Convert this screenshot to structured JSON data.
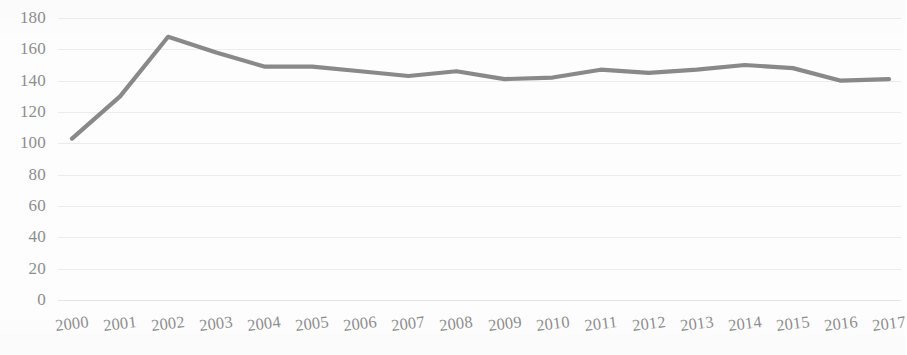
{
  "chart_data": {
    "type": "line",
    "title": "",
    "subtitle": "",
    "xlabel": "",
    "ylabel": "",
    "categories": [
      "2000",
      "2001",
      "2002",
      "2003",
      "2004",
      "2005",
      "2006",
      "2007",
      "2008",
      "2009",
      "2010",
      "2011",
      "2012",
      "2013",
      "2014",
      "2015",
      "2016",
      "2017"
    ],
    "values": [
      103,
      130,
      168,
      158,
      149,
      149,
      146,
      143,
      146,
      141,
      142,
      147,
      145,
      147,
      150,
      148,
      140,
      141
    ],
    "series": [
      {
        "name": "Series 1",
        "values": [
          103,
          130,
          168,
          158,
          149,
          149,
          146,
          143,
          146,
          141,
          142,
          147,
          145,
          147,
          150,
          148,
          140,
          141
        ],
        "color": "#7F7F80"
      }
    ],
    "ylim": [
      0,
      180
    ],
    "ytick_values": [
      180,
      160,
      140,
      120,
      100,
      80,
      60,
      40,
      20,
      0
    ],
    "ytick_labels": [
      "180",
      "160",
      "140",
      "120",
      "100",
      "80",
      "60",
      "40",
      "20",
      "0"
    ],
    "xtick_labels": [
      "2000",
      "2001",
      "2002",
      "2003",
      "2004",
      "2005",
      "2006",
      "2007",
      "2008",
      "2009",
      "2010",
      "2011",
      "2012",
      "2013",
      "2014",
      "2015",
      "2016",
      "2017"
    ],
    "grid": true,
    "grid_axis": "y",
    "grid_color": "#ECECED",
    "legend": false,
    "legend_position": "none",
    "line_color": "#7F7F80",
    "line_width": 4,
    "markers": false,
    "background_color": "#FDFDFD",
    "axis_label_color": "#8E8E90",
    "xtick_rotation_degrees": -7,
    "annotations": []
  }
}
